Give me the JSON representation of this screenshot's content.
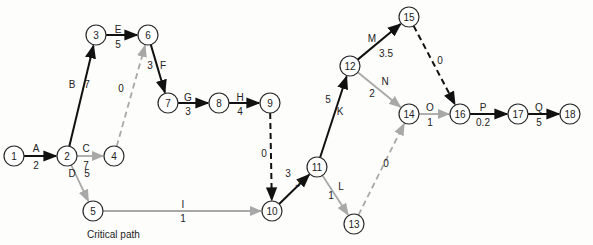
{
  "diagram": {
    "title": "",
    "caption": "Critical path",
    "colors": {
      "critical": "#111111",
      "noncritical": "#a8a8a8",
      "node_stroke": "#2a2a2a",
      "background": "#fdfdfc"
    },
    "nodes": [
      {
        "id": "1",
        "x": 14,
        "y": 156
      },
      {
        "id": "2",
        "x": 67,
        "y": 156
      },
      {
        "id": "3",
        "x": 96,
        "y": 35
      },
      {
        "id": "4",
        "x": 114,
        "y": 156
      },
      {
        "id": "5",
        "x": 93,
        "y": 211
      },
      {
        "id": "6",
        "x": 148,
        "y": 35
      },
      {
        "id": "7",
        "x": 168,
        "y": 103
      },
      {
        "id": "8",
        "x": 219,
        "y": 103
      },
      {
        "id": "9",
        "x": 270,
        "y": 103
      },
      {
        "id": "10",
        "x": 272,
        "y": 211
      },
      {
        "id": "11",
        "x": 317,
        "y": 167
      },
      {
        "id": "12",
        "x": 350,
        "y": 66
      },
      {
        "id": "13",
        "x": 354,
        "y": 224
      },
      {
        "id": "14",
        "x": 409,
        "y": 114
      },
      {
        "id": "15",
        "x": 409,
        "y": 17
      },
      {
        "id": "16",
        "x": 460,
        "y": 114
      },
      {
        "id": "17",
        "x": 518,
        "y": 114
      },
      {
        "id": "18",
        "x": 570,
        "y": 114
      }
    ],
    "activities": [
      {
        "from": "1",
        "to": "2",
        "name": "A",
        "duration": "2",
        "critical": true,
        "dummy": false,
        "nx": 36,
        "ny": 148,
        "dx": 36,
        "dy": 165
      },
      {
        "from": "2",
        "to": "3",
        "name": "B",
        "duration": "7",
        "critical": true,
        "dummy": false,
        "nx": 72,
        "ny": 84,
        "dx": 87,
        "dy": 84
      },
      {
        "from": "2",
        "to": "4",
        "name": "C",
        "duration": "7",
        "critical": false,
        "dummy": false,
        "nx": 86,
        "ny": 148,
        "dx": 86,
        "dy": 165
      },
      {
        "from": "2",
        "to": "5",
        "name": "D",
        "duration": "5",
        "critical": false,
        "dummy": false,
        "nx": 72,
        "ny": 173,
        "dx": 87,
        "dy": 173
      },
      {
        "from": "3",
        "to": "6",
        "name": "E",
        "duration": "5",
        "critical": true,
        "dummy": false,
        "nx": 118,
        "ny": 29,
        "dx": 118,
        "dy": 44
      },
      {
        "from": "4",
        "to": "6",
        "name": "",
        "duration": "0",
        "critical": false,
        "dummy": true,
        "nx": 0,
        "ny": 0,
        "dx": 121,
        "dy": 88
      },
      {
        "from": "6",
        "to": "7",
        "name": "F",
        "duration": "3",
        "critical": true,
        "dummy": false,
        "nx": 163,
        "ny": 65,
        "dx": 150,
        "dy": 65
      },
      {
        "from": "7",
        "to": "8",
        "name": "G",
        "duration": "3",
        "critical": true,
        "dummy": false,
        "nx": 188,
        "ny": 97,
        "dx": 188,
        "dy": 111
      },
      {
        "from": "8",
        "to": "9",
        "name": "H",
        "duration": "4",
        "critical": true,
        "dummy": false,
        "nx": 240,
        "ny": 97,
        "dx": 240,
        "dy": 111
      },
      {
        "from": "9",
        "to": "10",
        "name": "",
        "duration": "0",
        "critical": true,
        "dummy": true,
        "nx": 0,
        "ny": 0,
        "dx": 264,
        "dy": 153
      },
      {
        "from": "5",
        "to": "10",
        "name": "I",
        "duration": "1",
        "critical": false,
        "dummy": false,
        "nx": 183,
        "ny": 204,
        "dx": 183,
        "dy": 218
      },
      {
        "from": "10",
        "to": "11",
        "name": "J",
        "duration": "3",
        "critical": true,
        "dummy": false,
        "nx": 298,
        "ny": 183,
        "dx": 288,
        "dy": 173
      },
      {
        "from": "11",
        "to": "12",
        "name": "K",
        "duration": "5",
        "critical": true,
        "dummy": false,
        "nx": 340,
        "ny": 111,
        "dx": 328,
        "dy": 99
      },
      {
        "from": "11",
        "to": "13",
        "name": "L",
        "duration": "1",
        "critical": false,
        "dummy": false,
        "nx": 341,
        "ny": 186,
        "dx": 331,
        "dy": 195
      },
      {
        "from": "12",
        "to": "15",
        "name": "M",
        "duration": "3.5",
        "critical": true,
        "dummy": false,
        "nx": 372,
        "ny": 38,
        "dx": 386,
        "dy": 53
      },
      {
        "from": "12",
        "to": "14",
        "name": "N",
        "duration": "2",
        "critical": false,
        "dummy": false,
        "nx": 385,
        "ny": 81,
        "dx": 372,
        "dy": 93
      },
      {
        "from": "13",
        "to": "14",
        "name": "",
        "duration": "0",
        "critical": false,
        "dummy": true,
        "nx": 0,
        "ny": 0,
        "dx": 386,
        "dy": 163
      },
      {
        "from": "15",
        "to": "16",
        "name": "",
        "duration": "0",
        "critical": true,
        "dummy": true,
        "nx": 0,
        "ny": 0,
        "dx": 440,
        "dy": 60
      },
      {
        "from": "14",
        "to": "16",
        "name": "O",
        "duration": "1",
        "critical": false,
        "dummy": false,
        "nx": 430,
        "ny": 107,
        "dx": 430,
        "dy": 122
      },
      {
        "from": "16",
        "to": "17",
        "name": "P",
        "duration": "0.2",
        "critical": true,
        "dummy": false,
        "nx": 483,
        "ny": 107,
        "dx": 483,
        "dy": 122
      },
      {
        "from": "17",
        "to": "18",
        "name": "Q",
        "duration": "5",
        "critical": true,
        "dummy": false,
        "nx": 539,
        "ny": 107,
        "dx": 539,
        "dy": 122
      }
    ]
  }
}
